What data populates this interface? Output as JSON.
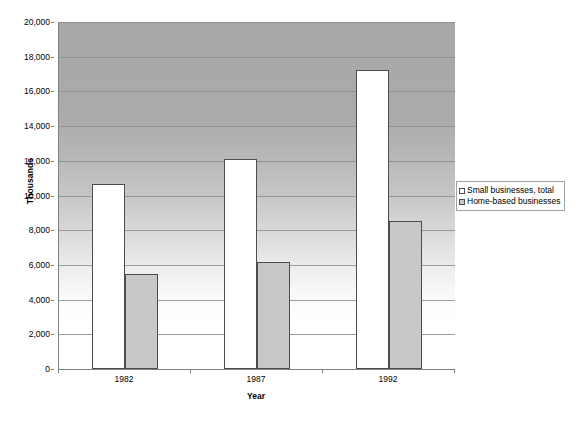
{
  "chart_data": {
    "type": "bar",
    "title": "",
    "subtitle": "",
    "xlabel": "Year",
    "ylabel": "Thousands",
    "categories": [
      "1982",
      "1987",
      "1992"
    ],
    "series": [
      {
        "name": "Small businesses, total",
        "color": "#ffffff",
        "values": [
          10650,
          12120,
          17250
        ]
      },
      {
        "name": "Home-based businesses",
        "color": "#c8c8c8",
        "values": [
          5500,
          6180,
          8550
        ]
      }
    ],
    "ylim": [
      0,
      20000
    ],
    "ytick_step": 2000,
    "ytick_labels": [
      "0",
      "2,000",
      "4,000",
      "6,000",
      "8,000",
      "10,000",
      "12,000",
      "14,000",
      "16,000",
      "18,000",
      "20,000"
    ],
    "ytick_values": [
      0,
      2000,
      4000,
      6000,
      8000,
      10000,
      12000,
      14000,
      16000,
      18000,
      20000
    ],
    "grid": true,
    "grid_axis": "y",
    "legend_position": "right",
    "legend_entries": [
      "Small businesses, total",
      "Home-based businesses"
    ],
    "plot_background": "vertical-gradient-gray-to-white",
    "axis_color": "#808080",
    "gridline_color": "#8c8c8c",
    "bar_border_color": "#4d4d4d"
  }
}
